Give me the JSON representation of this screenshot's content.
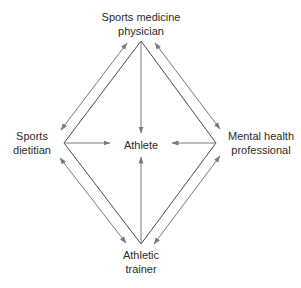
{
  "nodes": {
    "top": {
      "line1": "Sports medicine",
      "line2": "physician"
    },
    "left": {
      "line1": "Sports",
      "line2": "dietitian"
    },
    "right": {
      "line1": "Mental health",
      "line2": "professional"
    },
    "bottom": {
      "line1": "Athletic",
      "line2": "trainer"
    },
    "center": {
      "label": "Athlete"
    }
  },
  "colors": {
    "diamond": "#4a4a4a",
    "arrow": "#7a7a7a",
    "text": "#2b2b2b"
  }
}
